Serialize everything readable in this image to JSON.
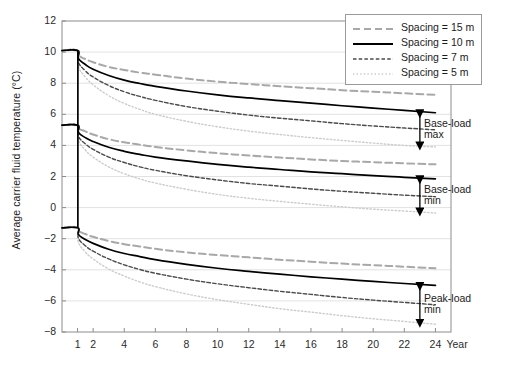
{
  "chart_data": {
    "type": "line",
    "title": "",
    "xlabel": "Year",
    "ylabel": "Average carrier fluid temperature (°C)",
    "xlim": [
      0,
      25
    ],
    "ylim": [
      -8,
      12
    ],
    "xticks": [
      1,
      2,
      4,
      6,
      8,
      10,
      12,
      14,
      16,
      18,
      20,
      22,
      24
    ],
    "yticks": [
      12,
      10,
      8,
      6,
      4,
      2,
      0,
      -2,
      -4,
      -6,
      -8
    ],
    "grid": "horizontal",
    "legend_position": "top-right",
    "legend": [
      {
        "label": "Spacing = 15 m",
        "style": "dashed-long",
        "color": "#a8a8a8"
      },
      {
        "label": "Spacing = 10 m",
        "style": "solid",
        "color": "#000000"
      },
      {
        "label": "Spacing = 7 m",
        "style": "dashed-short",
        "color": "#4a4a4a"
      },
      {
        "label": "Spacing = 5 m",
        "style": "dotted",
        "color": "#c9c9c9"
      }
    ],
    "x": [
      0,
      1,
      1.05,
      1.5,
      2,
      3,
      4,
      5,
      6,
      8,
      10,
      12,
      14,
      16,
      18,
      20,
      22,
      24
    ],
    "groups": [
      {
        "name": "Base-load max",
        "series": [
          {
            "name": "Spacing = 15 m",
            "values": [
              10.1,
              10.1,
              9.8,
              9.55,
              9.35,
              9.05,
              8.85,
              8.68,
              8.55,
              8.3,
              8.1,
              7.95,
              7.8,
              7.68,
              7.55,
              7.45,
              7.35,
              7.25
            ]
          },
          {
            "name": "Spacing = 10 m",
            "values": [
              10.1,
              10.1,
              9.6,
              9.2,
              8.9,
              8.5,
              8.2,
              7.98,
              7.8,
              7.5,
              7.25,
              7.05,
              6.88,
              6.72,
              6.55,
              6.4,
              6.25,
              6.1
            ]
          },
          {
            "name": "Spacing = 7 m",
            "values": [
              10.1,
              10.1,
              9.35,
              8.8,
              8.4,
              7.85,
              7.45,
              7.15,
              6.9,
              6.5,
              6.2,
              5.95,
              5.75,
              5.58,
              5.4,
              5.25,
              5.12,
              5.0
            ]
          },
          {
            "name": "Spacing = 5 m",
            "values": [
              10.1,
              10.1,
              9.1,
              8.4,
              7.9,
              7.2,
              6.7,
              6.32,
              6.0,
              5.55,
              5.2,
              4.92,
              4.7,
              4.5,
              4.32,
              4.15,
              4.0,
              3.9
            ]
          }
        ]
      },
      {
        "name": "Base-load min",
        "series": [
          {
            "name": "Spacing = 15 m",
            "values": [
              5.3,
              5.3,
              5.1,
              4.9,
              4.7,
              4.4,
              4.2,
              4.05,
              3.9,
              3.68,
              3.5,
              3.35,
              3.22,
              3.1,
              3.0,
              2.92,
              2.85,
              2.78
            ]
          },
          {
            "name": "Spacing = 10 m",
            "values": [
              5.3,
              5.3,
              4.85,
              4.5,
              4.25,
              3.88,
              3.62,
              3.42,
              3.25,
              3.0,
              2.78,
              2.6,
              2.45,
              2.3,
              2.18,
              2.05,
              1.95,
              1.85
            ]
          },
          {
            "name": "Spacing = 7 m",
            "values": [
              5.3,
              5.3,
              4.6,
              4.1,
              3.75,
              3.25,
              2.9,
              2.62,
              2.4,
              2.05,
              1.78,
              1.55,
              1.38,
              1.2,
              1.05,
              0.92,
              0.8,
              0.7
            ]
          },
          {
            "name": "Spacing = 5 m",
            "values": [
              5.3,
              5.3,
              4.35,
              3.7,
              3.25,
              2.62,
              2.18,
              1.85,
              1.58,
              1.18,
              0.85,
              0.6,
              0.4,
              0.22,
              0.05,
              -0.1,
              -0.22,
              -0.35
            ]
          }
        ]
      },
      {
        "name": "Peak-load min",
        "series": [
          {
            "name": "Spacing = 15 m",
            "values": [
              -1.3,
              -1.3,
              -1.5,
              -1.7,
              -1.88,
              -2.15,
              -2.35,
              -2.5,
              -2.65,
              -2.88,
              -3.05,
              -3.2,
              -3.35,
              -3.48,
              -3.6,
              -3.7,
              -3.8,
              -3.9
            ]
          },
          {
            "name": "Spacing = 10 m",
            "values": [
              -1.3,
              -1.3,
              -1.72,
              -2.05,
              -2.3,
              -2.68,
              -2.95,
              -3.15,
              -3.35,
              -3.65,
              -3.9,
              -4.1,
              -4.28,
              -4.45,
              -4.6,
              -4.75,
              -4.88,
              -5.0
            ]
          },
          {
            "name": "Spacing = 7 m",
            "values": [
              -1.3,
              -1.3,
              -1.95,
              -2.45,
              -2.8,
              -3.3,
              -3.68,
              -3.98,
              -4.22,
              -4.6,
              -4.9,
              -5.15,
              -5.38,
              -5.58,
              -5.78,
              -5.95,
              -6.1,
              -6.25
            ]
          },
          {
            "name": "Spacing = 5 m",
            "values": [
              -1.3,
              -1.3,
              -2.2,
              -2.85,
              -3.3,
              -3.95,
              -4.4,
              -4.78,
              -5.08,
              -5.55,
              -5.92,
              -6.22,
              -6.5,
              -6.72,
              -6.95,
              -7.15,
              -7.32,
              -7.5
            ]
          }
        ]
      }
    ],
    "annotations": [
      {
        "label": "Base-load\nmax",
        "label_line1": "Base-load",
        "label_line2": "max",
        "y_top": 6.1,
        "y_bottom": 3.9,
        "x": 23.0
      },
      {
        "label": "Base-load\nmin",
        "label_line1": "Base-load",
        "label_line2": "min",
        "y_top": 1.85,
        "y_bottom": -0.35,
        "x": 23.0
      },
      {
        "label": "Peak-load\nmin",
        "label_line1": "Peak-load",
        "label_line2": "min",
        "y_top": -5.0,
        "y_bottom": -7.5,
        "x": 23.0
      }
    ]
  },
  "axis": {
    "y_tick_labels": [
      "12",
      "10",
      "8",
      "6",
      "4",
      "2",
      "0",
      "−2",
      "−4",
      "−6",
      "−8"
    ],
    "x_tick_labels": [
      "1",
      "2",
      "4",
      "6",
      "8",
      "10",
      "12",
      "14",
      "16",
      "18",
      "20",
      "22",
      "24"
    ],
    "x_unit_label": "Year",
    "y_axis_title": "Average carrier fluid temperature (°C)"
  }
}
